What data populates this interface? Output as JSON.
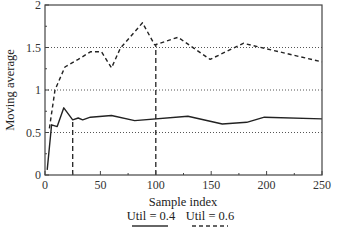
{
  "chart_data": {
    "type": "line",
    "title": "",
    "xlabel": "Sample index",
    "ylabel": "Moving average",
    "xlim": [
      0,
      250
    ],
    "ylim": [
      0,
      2
    ],
    "x_ticks": [
      0,
      50,
      100,
      150,
      200,
      250
    ],
    "y_ticks": [
      0,
      0.5,
      1,
      1.5,
      2
    ],
    "x_tick_labels": [
      "0",
      "50",
      "100",
      "150",
      "200",
      "250"
    ],
    "y_tick_labels": [
      "0",
      "0.5",
      "1",
      "1.5",
      "2"
    ],
    "grid": {
      "horizontal_dotted_at": [
        0.5,
        1,
        1.5
      ]
    },
    "legend_position": "bottom-center",
    "series": [
      {
        "name": "Util = 0.4",
        "style": "solid",
        "points": [
          [
            2,
            0.06
          ],
          [
            6,
            0.59
          ],
          [
            11,
            0.57
          ],
          [
            17,
            0.79
          ],
          [
            25,
            0.65
          ],
          [
            30,
            0.67
          ],
          [
            34,
            0.65
          ],
          [
            41,
            0.68
          ],
          [
            60,
            0.7
          ],
          [
            81,
            0.64
          ],
          [
            129,
            0.69
          ],
          [
            160,
            0.6
          ],
          [
            182,
            0.62
          ],
          [
            198,
            0.68
          ],
          [
            250,
            0.66
          ]
        ]
      },
      {
        "name": "Util = 0.6",
        "style": "dashed",
        "points": [
          [
            4,
            0.55
          ],
          [
            9,
            1.0
          ],
          [
            18,
            1.27
          ],
          [
            30,
            1.36
          ],
          [
            41,
            1.45
          ],
          [
            51,
            1.45
          ],
          [
            60,
            1.26
          ],
          [
            68,
            1.49
          ],
          [
            88,
            1.79
          ],
          [
            99,
            1.53
          ],
          [
            120,
            1.62
          ],
          [
            149,
            1.36
          ],
          [
            179,
            1.55
          ],
          [
            250,
            1.33
          ]
        ]
      }
    ],
    "annotations": [
      {
        "type": "vertical-dashed-line",
        "x": 25,
        "from_y": 0,
        "to_y": 0.65
      },
      {
        "type": "vertical-dashed-line",
        "x": 100,
        "from_y": 0,
        "to_y": 1.53
      }
    ]
  },
  "legend": {
    "items": [
      {
        "label": "Util = 0.4",
        "style": "solid"
      },
      {
        "label": "Util = 0.6",
        "style": "dashed"
      }
    ]
  },
  "axes": {
    "xlabel": "Sample index",
    "ylabel": "Moving average"
  }
}
